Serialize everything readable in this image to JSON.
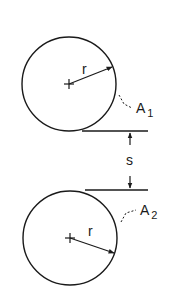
{
  "diagram": {
    "top_circle": {
      "radius_label": "r",
      "area_label": "A",
      "area_subscript": "1"
    },
    "bottom_circle": {
      "radius_label": "r",
      "area_label": "A",
      "area_subscript": "2"
    },
    "gap_label": "s",
    "colors": {
      "stroke": "#1a1a1a",
      "background": "#ffffff"
    }
  }
}
